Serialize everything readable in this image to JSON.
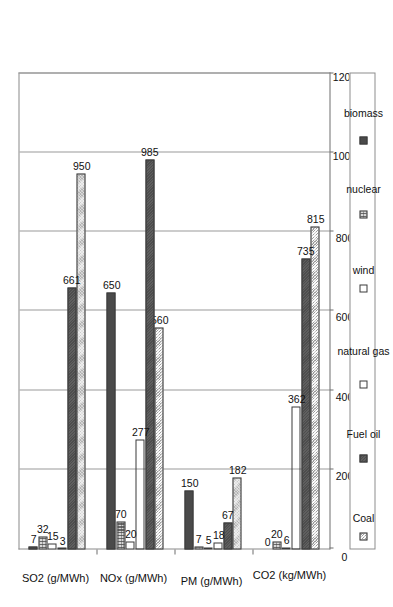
{
  "chart_data": {
    "type": "bar",
    "orientation": "rotated-90-ccw",
    "title": "",
    "subtitle": "",
    "xlabel": "",
    "ylabel": "",
    "categories": [
      "SO2 (g/MWh)",
      "NOx (g/MWh)",
      "PM (g/MWh)",
      "CO2 (kg/MWh)"
    ],
    "series": [
      {
        "name": "Coal",
        "values": [
          950,
          560,
          182,
          815
        ]
      },
      {
        "name": "Fuel oil",
        "values": [
          661,
          985,
          67,
          735
        ]
      },
      {
        "name": "natural gas",
        "values": [
          3,
          277,
          18,
          362
        ]
      },
      {
        "name": "wind",
        "values": [
          15,
          20,
          5,
          6
        ]
      },
      {
        "name": "nuclear",
        "values": [
          32,
          70,
          7,
          20
        ]
      },
      {
        "name": "biomass",
        "values": [
          7,
          650,
          150,
          0
        ]
      }
    ],
    "ylim": [
      0,
      1200
    ],
    "yticks": [
      0,
      200,
      400,
      600,
      800,
      1000,
      1200
    ],
    "ytick_labels": [
      "0",
      "200",
      "400",
      "600",
      "800",
      "1000",
      "1200"
    ],
    "grid": true,
    "grid_axis": "value",
    "legend": {
      "position": "bottom",
      "border": true
    },
    "data_labels": true,
    "colors": {
      "Coal": "#c9c9c9",
      "Fuel oil": "#4d4d4d",
      "natural gas": "#ffffff",
      "wind": "#ffffff",
      "nuclear": "#d7d7d7",
      "biomass": "#4a4a4a",
      "axis": "#6e6e6e",
      "grid": "#9a9a9a",
      "text": "#111111",
      "background": "#ffffff"
    },
    "patterns": {
      "Coal": "cross-dot-light",
      "Fuel oil": "solid-dark",
      "natural gas": "horizontal-lines",
      "wind": "empty-white",
      "nuclear": "grid-dots",
      "biomass": "solid-dark"
    }
  },
  "legend": {
    "items": [
      {
        "label": "Coal",
        "swatch": "coal-swatch-icon"
      },
      {
        "label": "Fuel oil",
        "swatch": "fueloil-swatch-icon"
      },
      {
        "label": "natural gas",
        "swatch": "gas-swatch-icon"
      },
      {
        "label": "wind",
        "swatch": "wind-swatch-icon"
      },
      {
        "label": "nuclear",
        "swatch": "nuclear-swatch-icon"
      },
      {
        "label": "biomass",
        "swatch": "biomass-swatch-icon"
      }
    ]
  }
}
